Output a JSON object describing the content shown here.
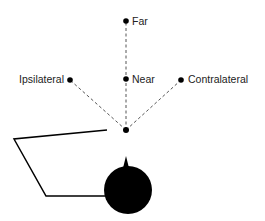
{
  "diagram": {
    "type": "target-position-schematic",
    "colors": {
      "ink": "#000000",
      "dashed_line": "#555555",
      "label": "#222222",
      "background": "#ffffff"
    },
    "origin": {
      "name": "fixation-point",
      "x": 126,
      "y": 130
    },
    "targets": [
      {
        "id": "far",
        "label": "Far",
        "x": 126,
        "y": 21,
        "label_side": "right"
      },
      {
        "id": "near",
        "label": "Near",
        "x": 126,
        "y": 79,
        "label_side": "right"
      },
      {
        "id": "ipsilateral",
        "label": "Ipsilateral",
        "x": 70,
        "y": 80,
        "label_side": "left"
      },
      {
        "id": "contralateral",
        "label": "Contralateral",
        "x": 181,
        "y": 80,
        "label_side": "right"
      }
    ],
    "head": {
      "cx": 128,
      "cy": 190,
      "r": 24,
      "nose_tip_y": 156
    },
    "arm": {
      "points": "107,130 14,139 46,196 105,196"
    }
  }
}
